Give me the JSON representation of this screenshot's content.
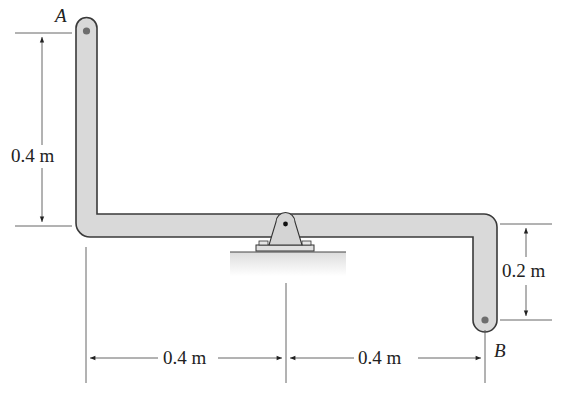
{
  "diagram": {
    "points": {
      "A": "A",
      "B": "B"
    },
    "dimensions": {
      "left_vertical": "0.4 m",
      "right_vertical": "0.2 m",
      "bottom_left": "0.4 m",
      "bottom_right": "0.4 m"
    },
    "colors": {
      "bar_fill": "#d9d9d9",
      "bar_stroke": "#3a3a3a",
      "pin": "#6e6e6e",
      "ground": "#e8e8e8",
      "dimension_line": "#444444"
    }
  }
}
